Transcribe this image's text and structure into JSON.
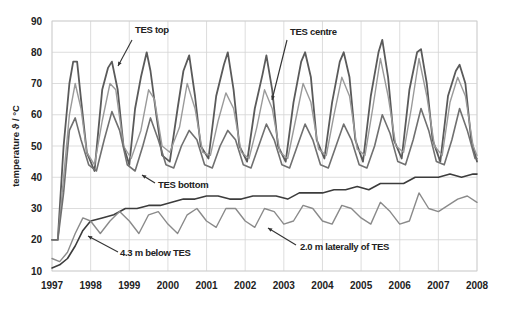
{
  "chart_data": {
    "type": "line",
    "title": "",
    "xlabel": "",
    "ylabel": "temperature ϑ / °C",
    "xlim": [
      1997,
      2008
    ],
    "ylim": [
      10,
      90
    ],
    "x_ticks": [
      "1997",
      "1998",
      "1999",
      "2000",
      "2001",
      "2002",
      "2003",
      "2004",
      "2005",
      "2006",
      "2007",
      "2008"
    ],
    "y_ticks": [
      "10",
      "20",
      "30",
      "40",
      "50",
      "60",
      "70",
      "80",
      "90"
    ],
    "grid": true,
    "legend": "none (inline annotations)",
    "series": [
      {
        "name": "TES top",
        "color": "#5a5a5a",
        "width": 1.8,
        "x": [
          1997.0,
          1997.15,
          1997.3,
          1997.45,
          1997.55,
          1997.65,
          1997.75,
          1997.9,
          1998.1,
          1998.3,
          1998.45,
          1998.55,
          1998.7,
          1998.85,
          1999.0,
          1999.15,
          1999.3,
          1999.45,
          1999.55,
          1999.7,
          1999.85,
          2000.05,
          2000.25,
          2000.4,
          2000.55,
          2000.7,
          2000.85,
          2001.05,
          2001.25,
          2001.45,
          2001.55,
          2001.7,
          2001.85,
          2002.05,
          2002.25,
          2002.45,
          2002.55,
          2002.7,
          2002.85,
          2003.05,
          2003.25,
          2003.45,
          2003.55,
          2003.7,
          2003.85,
          2004.05,
          2004.25,
          2004.45,
          2004.55,
          2004.7,
          2004.85,
          2005.05,
          2005.25,
          2005.45,
          2005.55,
          2005.7,
          2005.85,
          2006.05,
          2006.25,
          2006.45,
          2006.55,
          2006.7,
          2006.85,
          2007.05,
          2007.25,
          2007.45,
          2007.55,
          2007.7,
          2007.85,
          2008.0
        ],
        "y": [
          20,
          20,
          50,
          70,
          77,
          77,
          65,
          48,
          42,
          68,
          75,
          77,
          68,
          50,
          44,
          62,
          72,
          80,
          74,
          60,
          47,
          45,
          62,
          74,
          79,
          66,
          50,
          46,
          66,
          76,
          80,
          68,
          50,
          45,
          62,
          73,
          79,
          68,
          50,
          45,
          64,
          77,
          80,
          72,
          52,
          46,
          64,
          77,
          80,
          72,
          52,
          45,
          66,
          80,
          84,
          72,
          52,
          46,
          68,
          80,
          81,
          70,
          52,
          45,
          66,
          74,
          76,
          70,
          52,
          45
        ]
      },
      {
        "name": "TES centre",
        "color": "#9a9a9a",
        "width": 1.4,
        "x": [
          1997.0,
          1997.15,
          1997.3,
          1997.45,
          1997.6,
          1997.75,
          1997.9,
          1998.1,
          1998.3,
          1998.5,
          1998.65,
          1998.85,
          1999.05,
          1999.3,
          1999.5,
          1999.65,
          1999.85,
          2000.05,
          2000.3,
          2000.5,
          2000.7,
          2000.9,
          2001.1,
          2001.3,
          2001.5,
          2001.7,
          2001.9,
          2002.1,
          2002.3,
          2002.5,
          2002.7,
          2002.9,
          2003.1,
          2003.3,
          2003.5,
          2003.7,
          2003.9,
          2004.1,
          2004.3,
          2004.5,
          2004.7,
          2004.9,
          2005.1,
          2005.3,
          2005.5,
          2005.7,
          2005.9,
          2006.1,
          2006.3,
          2006.5,
          2006.7,
          2006.9,
          2007.1,
          2007.3,
          2007.5,
          2007.7,
          2007.9,
          2008.0
        ],
        "y": [
          20,
          20,
          40,
          60,
          70,
          62,
          48,
          44,
          58,
          70,
          68,
          50,
          46,
          55,
          68,
          65,
          50,
          48,
          56,
          70,
          62,
          48,
          47,
          58,
          67,
          62,
          48,
          46,
          56,
          68,
          62,
          48,
          46,
          58,
          70,
          64,
          49,
          47,
          60,
          72,
          66,
          49,
          47,
          62,
          78,
          66,
          50,
          48,
          62,
          78,
          66,
          50,
          47,
          64,
          72,
          66,
          50,
          47
        ]
      },
      {
        "name": "TES bottom",
        "color": "#707070",
        "width": 1.6,
        "x": [
          1997.0,
          1997.15,
          1997.3,
          1997.45,
          1997.6,
          1997.75,
          1997.95,
          1998.15,
          1998.35,
          1998.55,
          1998.75,
          1998.95,
          1999.15,
          1999.35,
          1999.55,
          1999.75,
          1999.95,
          2000.15,
          2000.35,
          2000.55,
          2000.75,
          2000.95,
          2001.15,
          2001.35,
          2001.55,
          2001.75,
          2001.95,
          2002.15,
          2002.35,
          2002.55,
          2002.75,
          2002.95,
          2003.15,
          2003.35,
          2003.55,
          2003.75,
          2003.95,
          2004.15,
          2004.35,
          2004.55,
          2004.75,
          2004.95,
          2005.15,
          2005.35,
          2005.55,
          2005.75,
          2005.95,
          2006.15,
          2006.35,
          2006.55,
          2006.75,
          2006.95,
          2007.15,
          2007.35,
          2007.55,
          2007.75,
          2007.95,
          2008.0
        ],
        "y": [
          20,
          20,
          35,
          55,
          59,
          52,
          44,
          42,
          52,
          61,
          55,
          44,
          42,
          50,
          59,
          52,
          44,
          43,
          50,
          55,
          52,
          44,
          43,
          50,
          55,
          52,
          44,
          43,
          50,
          57,
          52,
          44,
          43,
          50,
          57,
          52,
          44,
          43,
          50,
          57,
          52,
          44,
          43,
          50,
          60,
          54,
          45,
          44,
          52,
          62,
          55,
          45,
          44,
          52,
          62,
          55,
          46,
          46
        ]
      },
      {
        "name": "4.3 m below TES",
        "color": "#3c3c3c",
        "width": 1.6,
        "x": [
          1997.0,
          1997.2,
          1997.4,
          1997.6,
          1997.8,
          1998.0,
          1998.3,
          1998.6,
          1998.9,
          1999.2,
          1999.5,
          1999.8,
          2000.1,
          2000.4,
          2000.7,
          2001.0,
          2001.3,
          2001.6,
          2001.9,
          2002.2,
          2002.5,
          2002.8,
          2003.1,
          2003.4,
          2003.7,
          2004.0,
          2004.3,
          2004.6,
          2004.9,
          2005.2,
          2005.5,
          2005.8,
          2006.1,
          2006.4,
          2006.7,
          2007.0,
          2007.3,
          2007.6,
          2007.9,
          2008.0
        ],
        "y": [
          11,
          12,
          14,
          18,
          23,
          26,
          27,
          28,
          30,
          30,
          31,
          31,
          32,
          33,
          33,
          34,
          34,
          33,
          33,
          34,
          34,
          34,
          33,
          35,
          35,
          35,
          36,
          36,
          37,
          36,
          38,
          38,
          38,
          40,
          40,
          40,
          41,
          40,
          41,
          41
        ]
      },
      {
        "name": "2.0 m laterally of TES",
        "color": "#8a8a8a",
        "width": 1.4,
        "x": [
          1997.0,
          1997.2,
          1997.4,
          1997.6,
          1997.8,
          1998.0,
          1998.25,
          1998.5,
          1998.75,
          1999.0,
          1999.25,
          1999.5,
          1999.75,
          2000.0,
          2000.25,
          2000.5,
          2000.75,
          2001.0,
          2001.25,
          2001.5,
          2001.75,
          2002.0,
          2002.25,
          2002.5,
          2002.75,
          2003.0,
          2003.25,
          2003.5,
          2003.75,
          2004.0,
          2004.25,
          2004.5,
          2004.75,
          2005.0,
          2005.25,
          2005.5,
          2005.75,
          2006.0,
          2006.25,
          2006.5,
          2006.75,
          2007.0,
          2007.25,
          2007.5,
          2007.75,
          2008.0
        ],
        "y": [
          14,
          13,
          16,
          22,
          27,
          26,
          22,
          26,
          29,
          26,
          22,
          28,
          29,
          25,
          22,
          28,
          30,
          26,
          24,
          30,
          30,
          26,
          24,
          30,
          29,
          25,
          26,
          31,
          30,
          26,
          25,
          31,
          30,
          27,
          25,
          32,
          29,
          25,
          26,
          35,
          30,
          29,
          31,
          33,
          34,
          32
        ]
      }
    ],
    "annotations": [
      {
        "text": "TES top",
        "x": 135,
        "y": 33,
        "arrow": [
          [
            132,
            40
          ],
          [
            118,
            66
          ]
        ]
      },
      {
        "text": "TES centre",
        "x": 290,
        "y": 35,
        "arrow": [
          [
            287,
            40
          ],
          [
            272,
            100
          ]
        ]
      },
      {
        "text": "TES bottom",
        "x": 158,
        "y": 188,
        "arrow": [
          [
            155,
            183
          ],
          [
            142,
            175
          ]
        ]
      },
      {
        "text": "4.3 m below TES",
        "x": 120,
        "y": 256,
        "arrow": [
          [
            118,
            252
          ],
          [
            88,
            236
          ]
        ]
      },
      {
        "text": "2.0 m laterally of TES",
        "x": 300,
        "y": 250,
        "arrow": [
          [
            296,
            245
          ],
          [
            268,
            228
          ]
        ]
      }
    ]
  }
}
